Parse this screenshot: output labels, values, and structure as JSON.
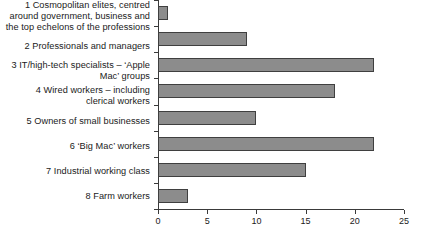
{
  "chart_data": {
    "type": "bar",
    "orientation": "horizontal",
    "title": "",
    "subtitle": "",
    "xlabel": "",
    "ylabel": "",
    "xlim": [
      0,
      25
    ],
    "xticks": [
      0,
      5,
      10,
      15,
      20,
      25
    ],
    "xtick_labels": [
      "0",
      "5",
      "10",
      "15",
      "20",
      "25"
    ],
    "grid": false,
    "legend": false,
    "bar_color": "#8c8c8c",
    "bar_border_color": "#3f3f3f",
    "axis_color": "#3a3a3a",
    "categories": [
      "1  Cosmopolitan elites, centred\naround government, business and\nthe top echelons of the professions",
      "2  Professionals and managers",
      "3  IT/high-tech specialists – ‘Apple\nMac’ groups",
      "4  Wired workers – including\nclerical workers",
      "5  Owners of small businesses",
      "6  ‘Big Mac’ workers",
      "7  Industrial working class",
      "8  Farm workers"
    ],
    "values": [
      1,
      9,
      22,
      18,
      10,
      22,
      15,
      3
    ]
  }
}
